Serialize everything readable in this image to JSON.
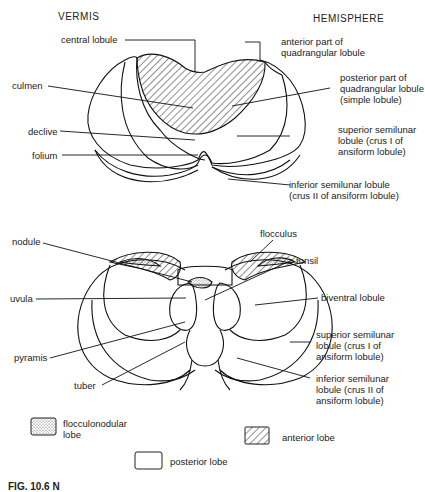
{
  "headers": {
    "left": "VERMIS",
    "right": "HEMISPHERE"
  },
  "top_view": {
    "labels": {
      "central_lobule": "central lobule",
      "culmen": "culmen",
      "declive": "declive",
      "folium": "folium",
      "anterior_quadrangular": [
        "anterior part of",
        "quadrangular lobule"
      ],
      "posterior_quadrangular": [
        "posterior part of",
        "quadrangular lobule",
        "(simple lobule)"
      ],
      "superior_semilunar": [
        "superior semilunar",
        "lobule (crus I of",
        "ansiform lobule)"
      ],
      "inferior_semilunar": [
        "inferior semilunar lobule",
        "(crus II of ansiform lobule)"
      ]
    }
  },
  "bottom_view": {
    "labels": {
      "nodule": "nodule",
      "uvula": "uvula",
      "pyramis": "pyramis",
      "tuber": "tuber",
      "flocculus": "flocculus",
      "tonsil": "tonsil",
      "biventral": "biventral lobule",
      "superior_semilunar": [
        "superior semilunar",
        "lobule (crus I of",
        "ansiform lobule)"
      ],
      "inferior_semilunar": [
        "inferior semilunar",
        "lobule (crus II of",
        "ansiform lobule)"
      ]
    }
  },
  "legend": {
    "flocculonodular": [
      "flocculonodular",
      "lobe"
    ],
    "anterior": "anterior lobe",
    "posterior": "posterior lobe"
  },
  "caption": "FIG. 10.6  N"
}
